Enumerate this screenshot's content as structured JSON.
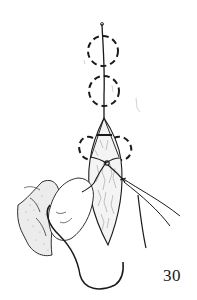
{
  "figure": {
    "number": "30",
    "elements": [
      "dashed-circles",
      "suture-thread",
      "wound",
      "knot",
      "hand",
      "forceps",
      "needle"
    ]
  },
  "colors": {
    "ink": "#1a1a1a",
    "background": "#ffffff",
    "shading": "#9a9a9a"
  }
}
